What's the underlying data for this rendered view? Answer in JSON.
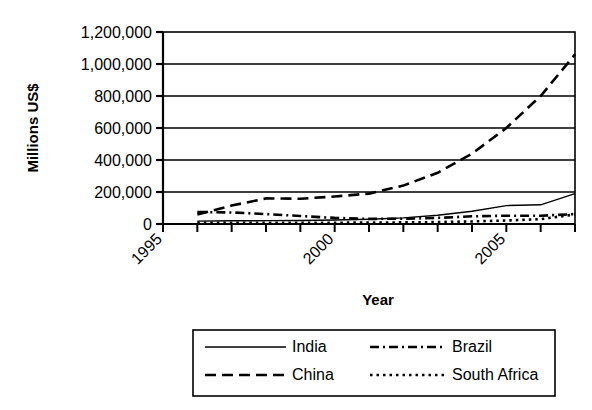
{
  "chart_data": {
    "type": "line",
    "title": "",
    "xlabel": "Year",
    "ylabel": "Millions US$",
    "xlim": [
      1995,
      2007
    ],
    "ylim": [
      0,
      1200000
    ],
    "grid": true,
    "legend_position": "bottom",
    "y_ticks": [
      "0",
      "200,000",
      "400,000",
      "600,000",
      "800,000",
      "1,000,000",
      "1,200,000"
    ],
    "y_tick_values": [
      0,
      200000,
      400000,
      600000,
      800000,
      1000000,
      1200000
    ],
    "x_ticks": [
      "1995",
      "2000",
      "2005"
    ],
    "x_tick_values": [
      1995,
      2000,
      2005
    ],
    "x_minor_values": [
      1995,
      1996,
      1997,
      1998,
      1999,
      2000,
      2001,
      2002,
      2003,
      2004,
      2005,
      2006,
      2007
    ],
    "x": [
      1996,
      1997,
      1998,
      1999,
      2000,
      2001,
      2002,
      2003,
      2004,
      2005,
      2006,
      2007
    ],
    "series": [
      {
        "name": "India",
        "style": "solid",
        "values": [
          18000,
          20000,
          21000,
          22000,
          25000,
          30000,
          38000,
          55000,
          80000,
          115000,
          120000,
          190000
        ]
      },
      {
        "name": "China",
        "style": "long-dash",
        "values": [
          60000,
          115000,
          160000,
          158000,
          172000,
          190000,
          240000,
          320000,
          440000,
          600000,
          800000,
          1060000
        ]
      },
      {
        "name": "Brazil",
        "style": "dash-dot",
        "values": [
          75000,
          72000,
          62000,
          50000,
          38000,
          32000,
          33000,
          38000,
          48000,
          52000,
          52000,
          62000
        ]
      },
      {
        "name": "South Africa",
        "style": "dotted",
        "values": [
          8000,
          8000,
          8000,
          8000,
          8000,
          9000,
          10000,
          12000,
          16000,
          22000,
          30000,
          60000
        ]
      }
    ]
  },
  "legend": {
    "entries": [
      {
        "label": "India",
        "style": "solid"
      },
      {
        "label": "Brazil",
        "style": "dash-dot"
      },
      {
        "label": "China",
        "style": "long-dash"
      },
      {
        "label": "South Africa",
        "style": "dotted"
      }
    ]
  }
}
